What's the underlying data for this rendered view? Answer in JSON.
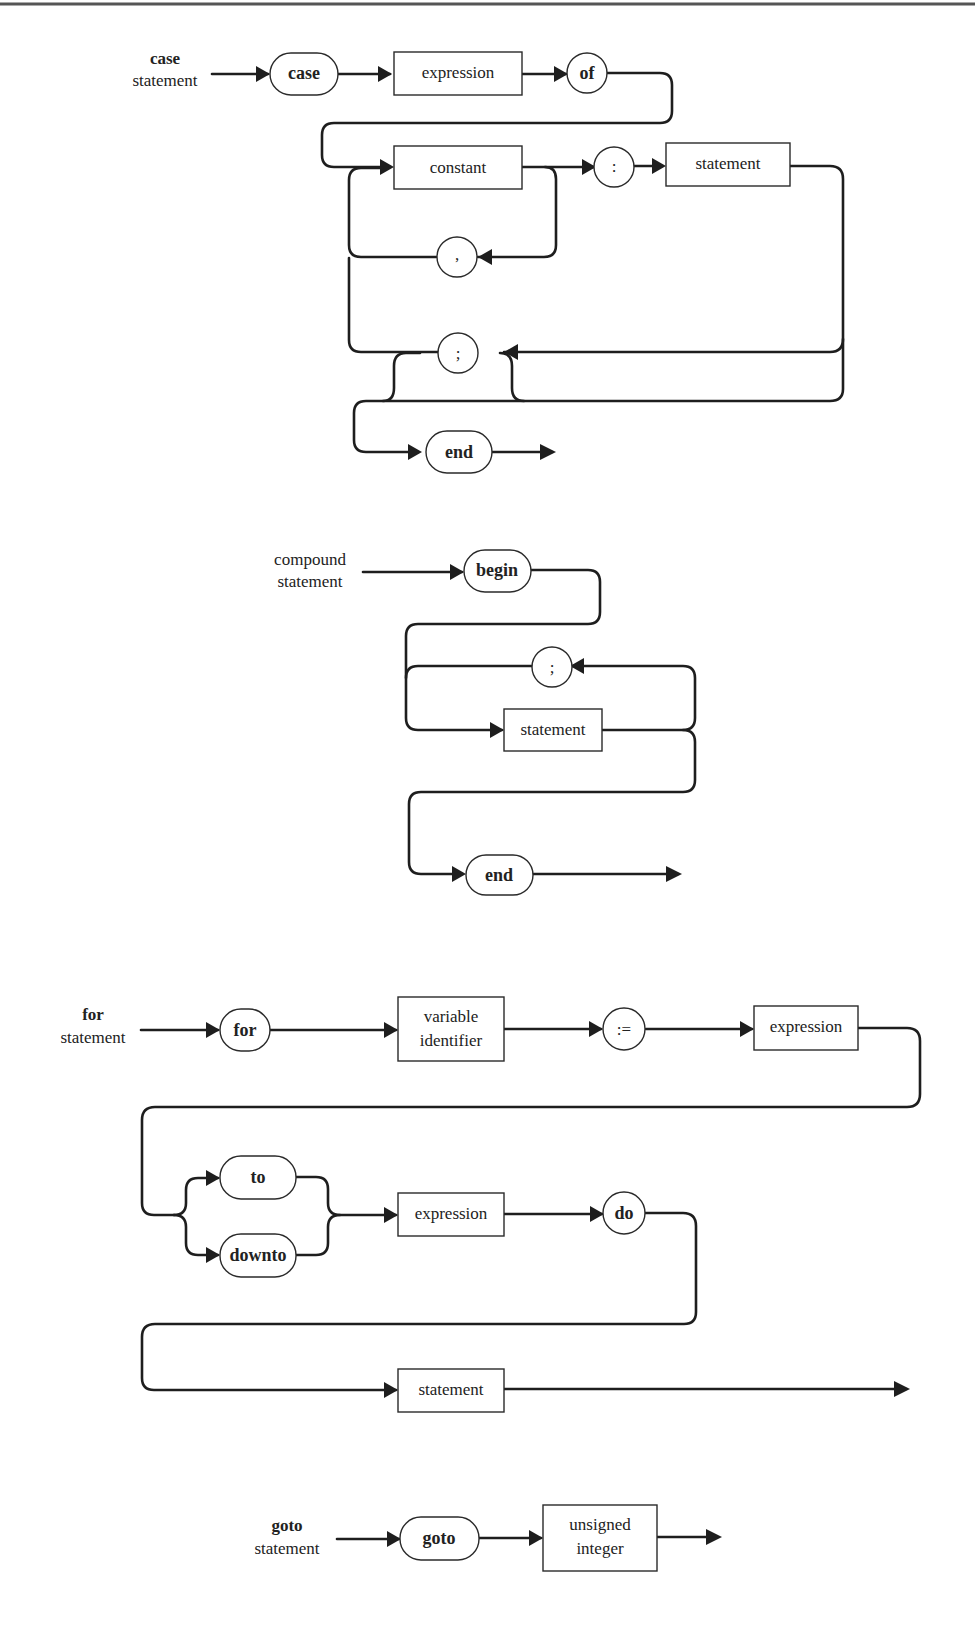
{
  "diagrams": {
    "case": {
      "label_bold": "case",
      "label": "statement",
      "keyword_case": "case",
      "expression": "expression",
      "keyword_of": "of",
      "constant": "constant",
      "colon": ":",
      "statement": "statement",
      "comma": ",",
      "semicolon": ";",
      "keyword_end": "end"
    },
    "compound": {
      "label_line1": "compound",
      "label_line2": "statement",
      "keyword_begin": "begin",
      "semicolon": ";",
      "statement": "statement",
      "keyword_end": "end"
    },
    "for": {
      "label_bold": "for",
      "label": "statement",
      "keyword_for": "for",
      "variable_line1": "variable",
      "variable_line2": "identifier",
      "assign": ":=",
      "expression1": "expression",
      "keyword_to": "to",
      "keyword_downto": "downto",
      "expression2": "expression",
      "keyword_do": "do",
      "statement": "statement"
    },
    "goto": {
      "label_bold": "goto",
      "label": "statement",
      "keyword_goto": "goto",
      "integer_line1": "unsigned",
      "integer_line2": "integer"
    }
  },
  "colors": {
    "line": "#1e1e1e",
    "background": "#ffffff"
  }
}
